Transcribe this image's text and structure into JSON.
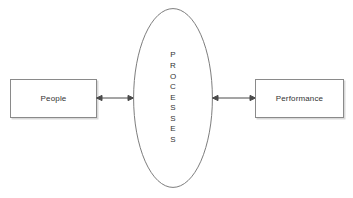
{
  "diagram": {
    "title": "",
    "background_color": "#ffffff",
    "stroke_color": "#8a8a8a",
    "text_color": "#333333",
    "nodes": [
      {
        "id": "people",
        "shape": "rectangle",
        "label": "People"
      },
      {
        "id": "processes",
        "shape": "ellipse",
        "label": "PROCESSES",
        "orientation": "vertical-stacked",
        "letters": [
          "P",
          "R",
          "O",
          "C",
          "E",
          "S",
          "S",
          "E",
          "S"
        ]
      },
      {
        "id": "performance",
        "shape": "rectangle",
        "label": "Performance"
      }
    ],
    "connectors": [
      {
        "id": "people-processes",
        "from": "people",
        "to": "processes",
        "style": "double-headed-arrow",
        "label": ""
      },
      {
        "id": "processes-performance",
        "from": "processes",
        "to": "performance",
        "style": "double-headed-arrow",
        "label": ""
      }
    ]
  }
}
